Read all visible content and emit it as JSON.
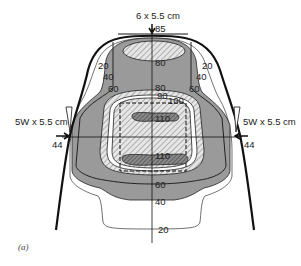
{
  "figure": {
    "caption": "(a)",
    "type": "isodose distribution"
  },
  "beams": {
    "anterior": {
      "label": "6 x 5.5 cm",
      "entry_dose": "85"
    },
    "left_lateral": {
      "label": "5W x 5.5 cm",
      "entry_dose": "44"
    },
    "right_lateral": {
      "label": "5W x 5.5 cm",
      "entry_dose": "44"
    }
  },
  "isodose_labels": {
    "top_left_20": "20",
    "top_left_40": "40",
    "top_left_60": "60",
    "top_right_20": "20",
    "top_right_40": "40",
    "top_right_60": "60",
    "center_80_upper": "80",
    "center_80_lower": "80",
    "center_90": "90",
    "center_100": "100",
    "center_110_upper": "110",
    "center_110_lower": "110",
    "bottom_60": "60",
    "bottom_40": "40",
    "bottom_20": "20"
  },
  "colors": {
    "grey_fill": "#9a9a9a",
    "dark_fill": "#5a5a5a",
    "line": "#111111",
    "background": "#ffffff"
  }
}
